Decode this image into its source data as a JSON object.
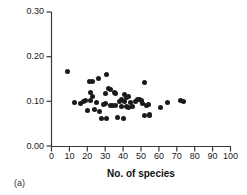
{
  "caption": "(a)",
  "chart_data": {
    "type": "scatter",
    "title": "",
    "xlabel": "No. of species",
    "ylabel": "Connectance",
    "xlim": [
      0,
      100
    ],
    "ylim": [
      0.0,
      0.3
    ],
    "xticks": [
      0,
      10,
      20,
      30,
      40,
      50,
      60,
      70,
      80,
      90,
      100
    ],
    "xtick_labels": [
      "0",
      "10",
      "20",
      "30",
      "40",
      "50",
      "60",
      "70",
      "80",
      "90",
      "100"
    ],
    "yticks": [
      0.0,
      0.1,
      0.2,
      0.3
    ],
    "ytick_labels": [
      "0.00",
      "0.10",
      "0.20",
      "0.30"
    ],
    "grid": false,
    "legend": null,
    "marker": {
      "shape": "circle",
      "color": "#1b1b1b",
      "size": 5
    },
    "series": [
      {
        "name": "food webs",
        "points": [
          [
            9,
            0.167
          ],
          [
            13,
            0.098
          ],
          [
            16,
            0.096
          ],
          [
            18,
            0.1
          ],
          [
            19,
            0.101
          ],
          [
            20,
            0.079
          ],
          [
            21,
            0.145
          ],
          [
            22,
            0.119
          ],
          [
            22,
            0.101
          ],
          [
            23,
            0.145
          ],
          [
            23,
            0.11
          ],
          [
            24,
            0.081
          ],
          [
            25,
            0.098
          ],
          [
            26,
            0.151
          ],
          [
            27,
            0.078
          ],
          [
            28,
            0.061
          ],
          [
            29,
            0.092
          ],
          [
            30,
            0.095
          ],
          [
            30,
            0.118
          ],
          [
            31,
            0.161
          ],
          [
            31,
            0.061
          ],
          [
            32,
            0.128
          ],
          [
            33,
            0.127
          ],
          [
            33,
            0.09
          ],
          [
            34,
            0.091
          ],
          [
            35,
            0.12
          ],
          [
            36,
            0.118
          ],
          [
            36,
            0.091
          ],
          [
            37,
            0.064
          ],
          [
            38,
            0.1
          ],
          [
            39,
            0.104
          ],
          [
            39,
            0.089
          ],
          [
            40,
            0.061
          ],
          [
            41,
            0.115
          ],
          [
            41,
            0.1
          ],
          [
            42,
            0.109
          ],
          [
            42,
            0.088
          ],
          [
            43,
            0.11
          ],
          [
            43,
            0.086
          ],
          [
            44,
            0.097
          ],
          [
            45,
            0.089
          ],
          [
            47,
            0.1
          ],
          [
            48,
            0.105
          ],
          [
            49,
            0.104
          ],
          [
            50,
            0.102
          ],
          [
            51,
            0.095
          ],
          [
            52,
            0.142
          ],
          [
            52,
            0.068
          ],
          [
            53,
            0.09
          ],
          [
            54,
            0.093
          ],
          [
            55,
            0.068
          ],
          [
            55,
            0.07
          ],
          [
            61,
            0.087
          ],
          [
            65,
            0.098
          ],
          [
            72,
            0.101
          ],
          [
            74,
            0.1
          ]
        ]
      }
    ]
  }
}
